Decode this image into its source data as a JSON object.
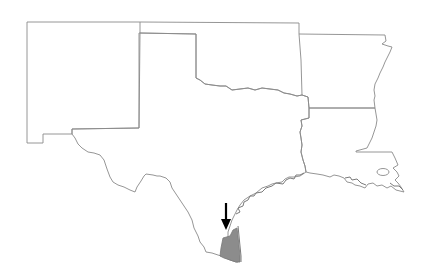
{
  "map": {
    "title": "",
    "states": [
      {
        "name": "New Mexico"
      },
      {
        "name": "Oklahoma"
      },
      {
        "name": "Arkansas"
      },
      {
        "name": "Texas"
      },
      {
        "name": "Louisiana"
      }
    ],
    "highlighted_region": {
      "description": "Southern Texas coastal region (Kenedy/Kleberg area)",
      "fill_color": "#8c8c8c"
    },
    "arrow": {
      "points_to": "highlighted_region",
      "color": "#000000"
    },
    "colors": {
      "background": "#ffffff",
      "border": "#8a8a8a"
    }
  }
}
